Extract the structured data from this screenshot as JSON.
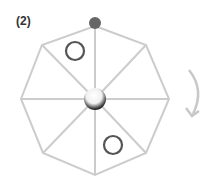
{
  "figure": {
    "label": "(2)",
    "shape": "octagon",
    "spokes": 8,
    "colors": {
      "outline": "#cccccc",
      "top_dot": "#666666",
      "markers": "#555555",
      "arrow": "#c8c8c8"
    },
    "markers": [
      {
        "name": "circle-upper-left",
        "type": "hollow-circle"
      },
      {
        "name": "circle-lower-right",
        "type": "hollow-circle"
      }
    ],
    "rotation": "clockwise"
  }
}
